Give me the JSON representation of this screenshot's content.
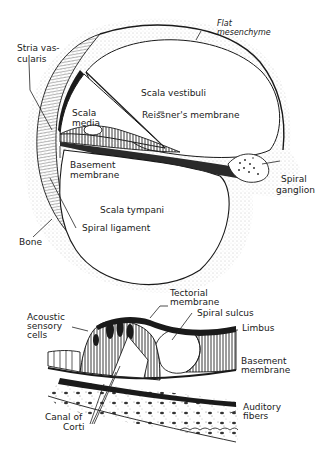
{
  "figure": {
    "top_panel": {
      "name": "cochlea-cross-section",
      "labels": {
        "flat_mesenchyme": [
          "Flat",
          "mesenchyme"
        ],
        "stria_vascularis": [
          "Stria vas-",
          "cularis"
        ],
        "scala_vestibuli": "Scala vestibuli",
        "scala_media": [
          "Scala",
          "media"
        ],
        "reissners_membrane": "Reissner's membrane",
        "basement_membrane": [
          "Basement",
          "membrane"
        ],
        "spiral_ganglion": [
          "Spiral",
          "ganglion"
        ],
        "scala_tympani": "Scala tympani",
        "spiral_ligament": "Spiral ligament",
        "bone": "Bone"
      }
    },
    "bottom_panel": {
      "name": "organ-of-corti-detail",
      "labels": {
        "tectorial_membrane": [
          "Tectorial",
          "membrane"
        ],
        "spiral_sulcus": "Spiral sulcus",
        "limbus": "Limbus",
        "acoustic_sensory_cells": [
          "Acoustic",
          "sensory",
          "cells"
        ],
        "basement_membrane": [
          "Basement",
          "membrane"
        ],
        "auditory_fibers": [
          "Auditory",
          "fibers"
        ],
        "canal_of_corti": [
          "Canal of",
          "Corti"
        ]
      }
    },
    "colors": {
      "ink": "#1a1a1a",
      "paper": "#ffffff",
      "stipple": "#9a9a9a"
    }
  }
}
